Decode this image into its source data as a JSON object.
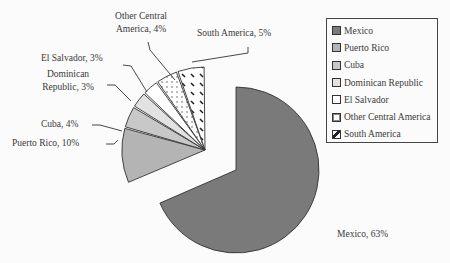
{
  "chart_data": {
    "type": "pie",
    "title": "",
    "exploded": [
      "Puerto Rico",
      "Cuba",
      "Dominican Republic",
      "El Salvador",
      "Other Central America",
      "South America"
    ],
    "legend_position": "right",
    "categories": [
      "Mexico",
      "Puerto Rico",
      "Cuba",
      "Dominican Republic",
      "El Salvador",
      "Other Central America",
      "South America"
    ],
    "values": [
      63,
      10,
      4,
      3,
      3,
      4,
      5
    ],
    "unit": "%",
    "colors": [
      "#7a7a7a",
      "#b4b4b4",
      "#c8c8c8",
      "#e2e2e2",
      "#ffffff",
      "dotted",
      "hatched"
    ]
  },
  "labels": {
    "mexico": "Mexico, 63%",
    "puerto_rico": "Puerto Rico, 10%",
    "cuba": "Cuba, 4%",
    "dominican_l1": "Dominican",
    "dominican_l2": "Republic, 3%",
    "el_salvador": "El Salvador, 3%",
    "other_l1": "Other Central",
    "other_l2": "America, 4%",
    "south_america": "South America, 5%"
  },
  "legend": {
    "items": [
      {
        "label": "Mexico"
      },
      {
        "label": "Puerto Rico"
      },
      {
        "label": "Cuba"
      },
      {
        "label": "Dominican Republic"
      },
      {
        "label": "El Salvador"
      },
      {
        "label": "Other Central America"
      },
      {
        "label": "South America"
      }
    ]
  }
}
